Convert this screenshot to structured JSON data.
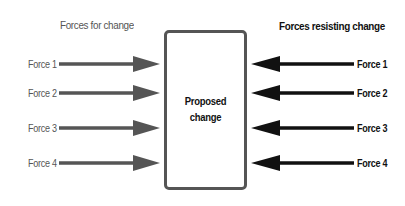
{
  "diagram": {
    "title_left": "Forces for change",
    "title_right": "Forces resisting change",
    "center": {
      "line1": "Proposed",
      "line2": "change"
    },
    "forces_for": [
      {
        "label": "Force 1"
      },
      {
        "label": "Force 2"
      },
      {
        "label": "Force 3"
      },
      {
        "label": "Force 4"
      }
    ],
    "forces_against": [
      {
        "label": "Force 1"
      },
      {
        "label": "Force 2"
      },
      {
        "label": "Force 3"
      },
      {
        "label": "Force 4"
      }
    ],
    "colors": {
      "forces_for": "#555555",
      "forces_against": "#111111",
      "box_border": "#555555"
    }
  }
}
